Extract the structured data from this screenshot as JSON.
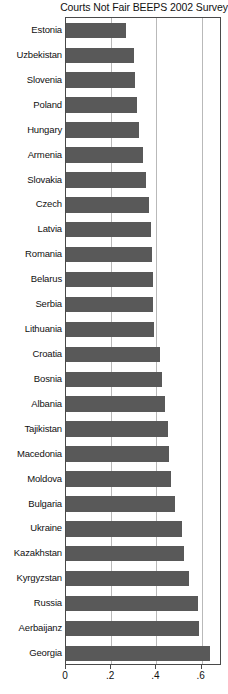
{
  "chart_data": {
    "type": "bar",
    "orientation": "horizontal",
    "title": "Courts Not Fair BEEPS 2002 Survey",
    "xlabel": "",
    "ylabel": "",
    "xlim": [
      0,
      0.69
    ],
    "ylim": null,
    "grid": true,
    "gridlines_x": [
      0.2,
      0.4,
      0.6
    ],
    "legend": null,
    "legend_position": "none",
    "xticks": [
      0,
      0.2,
      0.4,
      0.6
    ],
    "xtick_labels": [
      "0",
      ".2",
      ".4",
      ".6"
    ],
    "bar_color": "#595959",
    "categories": [
      "Estonia",
      "Uzbekistan",
      "Slovenia",
      "Poland",
      "Hungary",
      "Armenia",
      "Slovakia",
      "Czech",
      "Latvia",
      "Romania",
      "Belarus",
      "Serbia",
      "Lithuania",
      "Croatia",
      "Bosnia",
      "Albania",
      "Tajikistan",
      "Macedonia",
      "Moldova",
      "Bulgaria",
      "Ukraine",
      "Kazakhstan",
      "Kyrgyzstan",
      "Russia",
      "Aerbaijanz",
      "Georgia"
    ],
    "values": [
      0.265,
      0.3,
      0.305,
      0.315,
      0.325,
      0.34,
      0.355,
      0.365,
      0.375,
      0.38,
      0.385,
      0.385,
      0.39,
      0.415,
      0.425,
      0.44,
      0.45,
      0.455,
      0.465,
      0.48,
      0.515,
      0.52,
      0.545,
      0.585,
      0.59,
      0.635
    ]
  },
  "colors": {
    "bar": "#595959",
    "frame": "#4a4a4a",
    "gridline": "#b9b9b9",
    "background": "#ffffff",
    "text": "#111111"
  }
}
